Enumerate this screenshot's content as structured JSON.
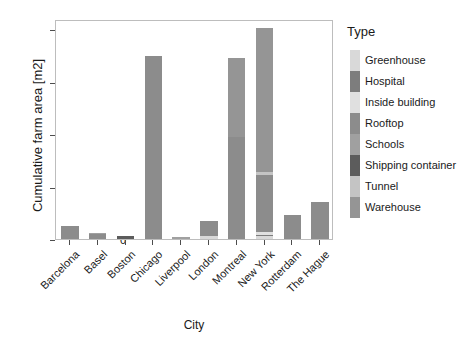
{
  "chart_data": {
    "type": "bar",
    "subtype": "stacked",
    "title": "",
    "xlabel": "City",
    "ylabel": "Cumulative farm area [m2]",
    "ylim": [
      0,
      8400
    ],
    "yticks": [
      0,
      2000,
      4000,
      6000,
      8000
    ],
    "ytick_labels": [
      "0",
      "2000",
      "4000",
      "6000",
      "8000"
    ],
    "grid": false,
    "legend_title": "Type",
    "legend_position": "right",
    "categories": [
      "Barcelona",
      "Basel",
      "Boston",
      "Chicago",
      "Liverpool",
      "London",
      "Montreal",
      "New York",
      "Rotterdam",
      "The Hague"
    ],
    "series": [
      {
        "name": "Greenhouse",
        "color": "#d9d9d9",
        "values": [
          0,
          0,
          0,
          0,
          0,
          130,
          0,
          100,
          0,
          0
        ]
      },
      {
        "name": "Hospital",
        "color": "#7d7d7d",
        "values": [
          0,
          0,
          0,
          0,
          0,
          0,
          0,
          60,
          0,
          0
        ]
      },
      {
        "name": "Inside building",
        "color": "#e0e0e0",
        "values": [
          0,
          0,
          0,
          0,
          0,
          0,
          0,
          120,
          0,
          0
        ]
      },
      {
        "name": "Rooftop",
        "color": "#8c8c8c",
        "values": [
          500,
          200,
          0,
          7000,
          0,
          540,
          3900,
          2170,
          900,
          1400
        ]
      },
      {
        "name": "Schools",
        "color": "#a0a0a0",
        "values": [
          0,
          30,
          0,
          0,
          80,
          0,
          0,
          0,
          0,
          0
        ]
      },
      {
        "name": "Shipping container",
        "color": "#5c5c5c",
        "values": [
          0,
          0,
          120,
          0,
          0,
          0,
          0,
          0,
          0,
          0
        ]
      },
      {
        "name": "Tunnel",
        "color": "#c4c4c4",
        "values": [
          0,
          0,
          0,
          0,
          0,
          0,
          0,
          100,
          0,
          0
        ]
      },
      {
        "name": "Warehouse",
        "color": "#959595",
        "values": [
          0,
          0,
          0,
          0,
          0,
          0,
          3000,
          5500,
          0,
          0
        ]
      }
    ],
    "totals": [
      500,
      230,
      120,
      7000,
      80,
      670,
      6900,
      8050,
      900,
      1400
    ],
    "axis_color": "#4d4d4d",
    "panel_border_color": "#bdbdbd",
    "background": "#ffffff"
  }
}
